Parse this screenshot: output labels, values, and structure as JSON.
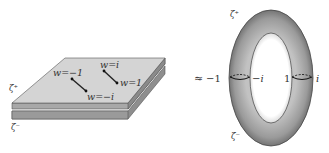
{
  "left_figure": {
    "sheet_upper_label": "ζ⁺",
    "sheet_lower_label": "ζ⁻",
    "branch_points": [
      {
        "label": "w=−1"
      },
      {
        "label": "w=−i"
      },
      {
        "label": "w=i"
      },
      {
        "label": "w=1"
      }
    ]
  },
  "relation_symbol": "≈",
  "right_figure": {
    "top_label": "ζ⁺",
    "bottom_label": "ζ⁻",
    "left_cut_outer": "−1",
    "left_cut_inner": "−i",
    "right_cut_inner": "1",
    "right_cut_outer": "i"
  },
  "colors": {
    "sheet_top": "#d4d4d4",
    "sheet_bottom": "#9a9a9a",
    "torus_dark": "#555555",
    "torus_light": "#b0b0b0",
    "line": "#222222"
  }
}
